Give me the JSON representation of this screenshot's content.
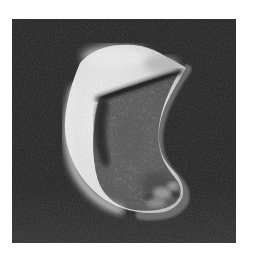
{
  "figure": {
    "alt": "Grayscale close-up photograph of a pale crescent-shaped specimen with a smooth bright outer rim, a rough granular fractured interior surface, a dark diagonal crease beneath the upper lobe, a hooked point at the upper right, and a rounded knob at the lower right, set against a dark grainy black background",
    "style": "black-and-white scanned photograph with film grain"
  },
  "colors": {
    "page_background": "#ffffff",
    "photo_background": "#111111",
    "specimen_highlight": "#ffffff",
    "specimen_light": "#f2f2f2",
    "specimen_mid": "#8a8a8a",
    "specimen_rim_shadow": "#787878",
    "specimen_crevice": "#1c1c1c"
  }
}
